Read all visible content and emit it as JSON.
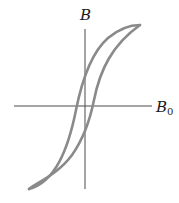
{
  "diagram": {
    "type": "hysteresis-loop",
    "y_axis_label": "B",
    "x_axis_label_main": "B",
    "x_axis_label_sub": "0",
    "colors": {
      "axis": "#4a4a4a",
      "curve": "#8a8a8a",
      "text": "#1a1a1a",
      "background": "#ffffff"
    }
  }
}
